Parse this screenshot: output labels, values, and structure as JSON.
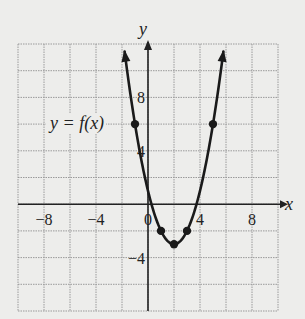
{
  "chart_data": {
    "type": "line",
    "title": "",
    "curve_label": "y = f(x)",
    "function": "f(x) = (x - 2)^2 - 3",
    "xlabel": "x",
    "ylabel": "y",
    "xlim": [
      -10,
      10
    ],
    "ylim": [
      -8,
      12
    ],
    "grid": true,
    "grid_step": 2,
    "x_ticks": [
      {
        "value": -8,
        "label": "−8"
      },
      {
        "value": -4,
        "label": "−4"
      },
      {
        "value": 0,
        "label": "0"
      },
      {
        "value": 4,
        "label": "4"
      },
      {
        "value": 8,
        "label": "8"
      }
    ],
    "y_ticks": [
      {
        "value": 8,
        "label": "8"
      },
      {
        "value": 4,
        "label": "4"
      },
      {
        "value": -4,
        "label": "−4"
      }
    ],
    "points": [
      {
        "x": -1,
        "y": 6
      },
      {
        "x": 1,
        "y": -2
      },
      {
        "x": 2,
        "y": -3
      },
      {
        "x": 3,
        "y": -2
      },
      {
        "x": 5,
        "y": 6
      }
    ],
    "colors": {
      "curve": "#1a1a1a",
      "grid": "#9a9a9a",
      "axis": "#222222",
      "background": "#ededeb"
    }
  }
}
